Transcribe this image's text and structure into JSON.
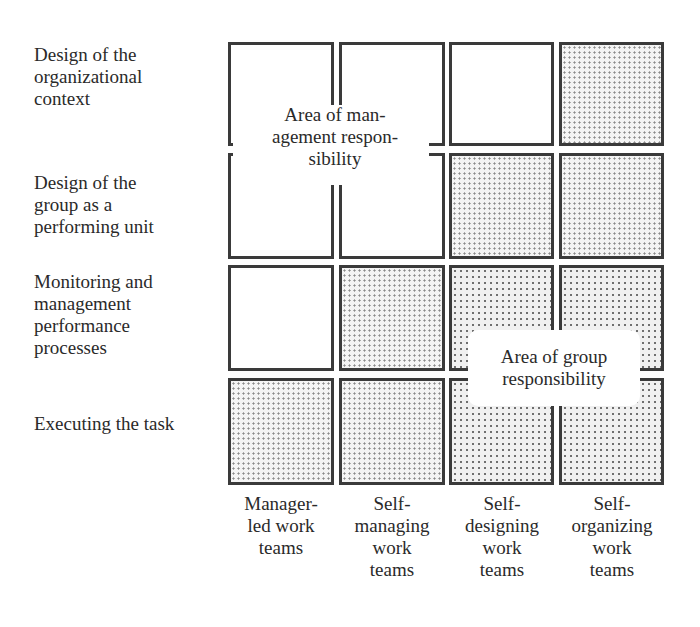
{
  "rows": [
    {
      "label": "Design of the organizational context",
      "lines": [
        "Design of the",
        "organizational",
        "context"
      ]
    },
    {
      "label": "Design of the group as a performing unit",
      "lines": [
        "Design of the",
        "group as a",
        "performing unit"
      ]
    },
    {
      "label": "Monitoring and management performance processes",
      "lines": [
        "Monitoring and",
        "management",
        "performance",
        "processes"
      ]
    },
    {
      "label": "Executing the task",
      "lines": [
        "Executing the task"
      ]
    }
  ],
  "columns": [
    {
      "label": "Manager-led work teams",
      "lines": [
        "Manager-",
        "led work",
        "teams"
      ]
    },
    {
      "label": "Self-managing work teams",
      "lines": [
        "Self-",
        "managing",
        "work",
        "teams"
      ]
    },
    {
      "label": "Self-designing work teams",
      "lines": [
        "Self-",
        "designing",
        "work",
        "teams"
      ]
    },
    {
      "label": "Self-organizing work teams",
      "lines": [
        "Self-",
        "organizing",
        "work",
        "teams"
      ]
    }
  ],
  "grid": [
    [
      "management",
      "management",
      "management",
      "group"
    ],
    [
      "management",
      "management",
      "group",
      "group"
    ],
    [
      "management",
      "group",
      "group",
      "group"
    ],
    [
      "group",
      "group",
      "group",
      "group"
    ]
  ],
  "areas": {
    "management": {
      "lines": [
        "Area of man-",
        "agement respon-",
        "sibility"
      ]
    },
    "group": {
      "lines": [
        "Area of group",
        "responsibility"
      ]
    }
  },
  "colors": {
    "border": "#3a3a3a",
    "background": "#ffffff",
    "text": "#2a2a2a",
    "dot": "#7a7a7a"
  }
}
